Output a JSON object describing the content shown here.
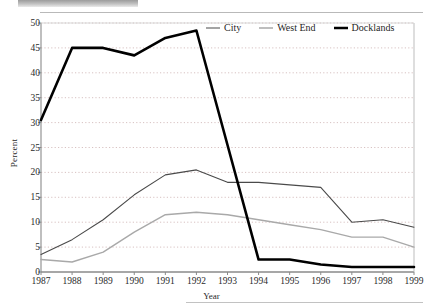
{
  "chart_data": {
    "type": "line",
    "title": "",
    "xlabel": "Year",
    "ylabel": "Percent",
    "x": [
      1987,
      1988,
      1989,
      1990,
      1991,
      1992,
      1993,
      1994,
      1995,
      1996,
      1997,
      1998,
      1999
    ],
    "categories": [
      "1987",
      "1988",
      "1989",
      "1990",
      "1991",
      "1992",
      "1993",
      "1994",
      "1995",
      "1996",
      "1997",
      "1998",
      "1999"
    ],
    "ylim": [
      0,
      50
    ],
    "yticks": [
      0,
      5,
      10,
      15,
      20,
      25,
      30,
      35,
      40,
      45,
      50
    ],
    "ytick_labels": [
      "0",
      "5",
      "10",
      "15",
      "20",
      "25",
      "30",
      "35",
      "40",
      "45",
      "50"
    ],
    "grid": true,
    "grid_style": "dotted-horizontal",
    "legend_position": "top-right inside plot",
    "series": [
      {
        "name": "City",
        "color": "#4a4a4a",
        "width": 1.1,
        "values": [
          3.5,
          6.5,
          10.5,
          15.5,
          19.5,
          20.5,
          18.0,
          18.0,
          17.5,
          17.0,
          10.0,
          10.5,
          9.0
        ]
      },
      {
        "name": "West End",
        "color": "#a9a9a9",
        "width": 1.4,
        "values": [
          2.5,
          2.0,
          4.0,
          8.0,
          11.5,
          12.0,
          11.5,
          10.5,
          9.5,
          8.5,
          7.0,
          7.0,
          5.0
        ]
      },
      {
        "name": "Docklands",
        "color": "#000000",
        "width": 2.6,
        "values": [
          30.5,
          45.0,
          45.0,
          43.5,
          47.0,
          48.5,
          25.5,
          2.5,
          2.5,
          1.5,
          1.0,
          1.0,
          1.0
        ]
      }
    ]
  },
  "legend": {
    "items": [
      {
        "label": "City"
      },
      {
        "label": "West End"
      },
      {
        "label": "Docklands"
      }
    ]
  }
}
